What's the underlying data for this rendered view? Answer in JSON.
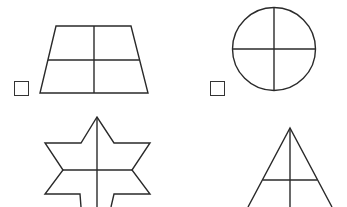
{
  "worksheet": {
    "description": "Shapes divided by lines; choose the shape(s) divided into equal parts",
    "colors": {
      "background": "#ffffff",
      "stroke": "#2a2a2a"
    },
    "items": [
      {
        "id": "trapezoid",
        "shape": "trapezoid",
        "divisions": "vertical and horizontal line (4 parts)",
        "has_checkbox": true,
        "checked": false
      },
      {
        "id": "circle",
        "shape": "circle",
        "divisions": "vertical and horizontal diameter (4 parts)",
        "has_checkbox": true,
        "checked": false
      },
      {
        "id": "star",
        "shape": "six-pointed star",
        "divisions": "vertical and horizontal line",
        "has_checkbox": false,
        "checked": false
      },
      {
        "id": "triangle",
        "shape": "triangle",
        "divisions": "vertical and horizontal line",
        "has_checkbox": false,
        "checked": false
      }
    ]
  }
}
